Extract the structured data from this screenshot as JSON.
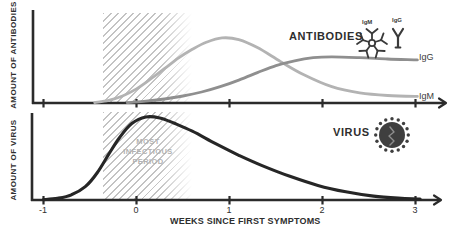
{
  "figure": {
    "x_axis_label": "WEEKS SINCE FIRST SYMPTOMS",
    "x_tick_labels": [
      "-1",
      "0",
      "1",
      "2",
      "3"
    ],
    "annotations": {
      "antibodies_ylabel": "AMOUNT OF ANTIBODIES",
      "virus_ylabel": "AMOUNT OF VIRUS",
      "antibodies_title": "ANTIBODIES",
      "virus_title": "VIRUS",
      "igm_icon_label": "IgM",
      "igg_icon_label": "IgG",
      "igg_curve_label": "IgG",
      "igm_curve_label": "IgM",
      "infectious_line1": "MOST",
      "infectious_line2": "INFECTIOUS",
      "infectious_line3": "PERIOD"
    },
    "colors": {
      "axis": "#2b2b2b",
      "curve_igm": "#b3b3b3",
      "curve_igg": "#8f8f8f",
      "curve_virus": "#262626",
      "hatch": "#c3c3c3",
      "muted_text": "#b2b2b2",
      "icon": "#3a3a3a",
      "virus_body": "#3f3f3f",
      "virus_squiggle": "#8f8f8f"
    }
  },
  "chart_data": [
    {
      "type": "line",
      "title": "ANTIBODIES",
      "ylabel": "AMOUNT OF ANTIBODIES",
      "xlabel": "WEEKS SINCE FIRST SYMPTOMS",
      "x_ticks": [
        -1,
        0,
        1,
        2,
        3
      ],
      "xlim": [
        -1.15,
        3.35
      ],
      "ylim": [
        0,
        1
      ],
      "grid": false,
      "legend_position": "right-of-curve-ends",
      "highlight_band_weeks": [
        -0.36,
        0.63
      ],
      "series": [
        {
          "name": "IgM",
          "color": "#b3b3b3",
          "x": [
            -0.45,
            -0.3,
            -0.15,
            0,
            0.15,
            0.3,
            0.45,
            0.6,
            0.75,
            0.92,
            1.1,
            1.3,
            1.55,
            1.8,
            2.1,
            2.4,
            2.7,
            3.02
          ],
          "y": [
            0.005,
            0.03,
            0.08,
            0.16,
            0.27,
            0.39,
            0.51,
            0.61,
            0.69,
            0.74,
            0.72,
            0.63,
            0.47,
            0.32,
            0.185,
            0.115,
            0.085,
            0.075
          ]
        },
        {
          "name": "IgG",
          "color": "#8f8f8f",
          "x": [
            -0.1,
            0.1,
            0.3,
            0.5,
            0.7,
            0.9,
            1.1,
            1.3,
            1.5,
            1.7,
            1.9,
            2.1,
            2.4,
            2.7,
            3.02
          ],
          "y": [
            0.005,
            0.02,
            0.045,
            0.08,
            0.125,
            0.185,
            0.26,
            0.345,
            0.425,
            0.48,
            0.515,
            0.525,
            0.515,
            0.5,
            0.49
          ]
        }
      ]
    },
    {
      "type": "line",
      "title": "VIRUS",
      "ylabel": "AMOUNT OF VIRUS",
      "xlabel": "WEEKS SINCE FIRST SYMPTOMS",
      "x_ticks": [
        -1,
        0,
        1,
        2,
        3
      ],
      "xlim": [
        -1.15,
        3.35
      ],
      "ylim": [
        0,
        1
      ],
      "grid": false,
      "highlight_band_weeks": [
        -0.36,
        0.63
      ],
      "annotation_in_band": "MOST INFECTIOUS PERIOD",
      "series": [
        {
          "name": "Virus",
          "color": "#262626",
          "x": [
            -1,
            -0.85,
            -0.7,
            -0.55,
            -0.42,
            -0.3,
            -0.18,
            -0.05,
            0.1,
            0.25,
            0.4,
            0.6,
            0.85,
            1.1,
            1.35,
            1.65,
            1.95,
            2.25,
            2.55,
            2.85,
            3.05
          ],
          "y": [
            0.005,
            0.02,
            0.06,
            0.155,
            0.32,
            0.53,
            0.73,
            0.89,
            0.965,
            0.955,
            0.895,
            0.8,
            0.655,
            0.52,
            0.4,
            0.275,
            0.17,
            0.095,
            0.045,
            0.02,
            0.012
          ]
        }
      ]
    }
  ]
}
